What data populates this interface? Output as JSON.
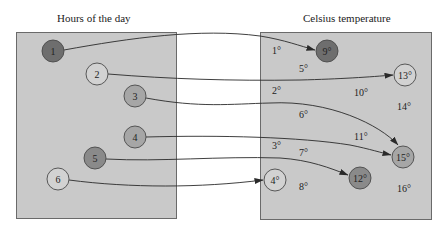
{
  "domain_sets": {
    "title": "Hours of the day",
    "items": [
      {
        "label": "1",
        "cx": 53,
        "cy": 51,
        "fill": "#6e6e6e"
      },
      {
        "label": "2",
        "cx": 97,
        "cy": 74,
        "fill": "#d2d2d2"
      },
      {
        "label": "3",
        "cx": 135,
        "cy": 96,
        "fill": "#a6a6a6"
      },
      {
        "label": "4",
        "cx": 135,
        "cy": 137,
        "fill": "#a6a6a6"
      },
      {
        "label": "5",
        "cx": 95,
        "cy": 158,
        "fill": "#8a8a8a"
      },
      {
        "label": "6",
        "cx": 58,
        "cy": 179,
        "fill": "#d2d2d2"
      }
    ]
  },
  "codomain_set": {
    "title": "Celsius temperature",
    "circled_items": [
      {
        "label": "9°",
        "cx": 327,
        "cy": 51,
        "fill": "#6e6e6e"
      },
      {
        "label": "13°",
        "cx": 405,
        "cy": 75,
        "fill": "#d2d2d2"
      },
      {
        "label": "15°",
        "cx": 403,
        "cy": 157,
        "fill": "#a6a6a6"
      },
      {
        "label": "12°",
        "cx": 360,
        "cy": 178,
        "fill": "#8a8a8a"
      },
      {
        "label": "4°",
        "cx": 275,
        "cy": 180,
        "fill": "#d2d2d2"
      }
    ],
    "free_items": [
      {
        "label": "1°",
        "x": 272,
        "y": 54
      },
      {
        "label": "5°",
        "x": 299,
        "y": 72
      },
      {
        "label": "2°",
        "x": 272,
        "y": 94
      },
      {
        "label": "10°",
        "x": 354,
        "y": 96
      },
      {
        "label": "14°",
        "x": 397,
        "y": 110
      },
      {
        "label": "6°",
        "x": 299,
        "y": 118
      },
      {
        "label": "11°",
        "x": 354,
        "y": 140
      },
      {
        "label": "3°",
        "x": 272,
        "y": 149
      },
      {
        "label": "7°",
        "x": 299,
        "y": 156
      },
      {
        "label": "8°",
        "x": 299,
        "y": 190
      },
      {
        "label": "16°",
        "x": 397,
        "y": 192
      }
    ]
  },
  "mappings": [
    {
      "from": "1",
      "to": "9°"
    },
    {
      "from": "2",
      "to": "13°"
    },
    {
      "from": "3",
      "to": "15°"
    },
    {
      "from": "4",
      "to": "15°"
    },
    {
      "from": "5",
      "to": "12°"
    },
    {
      "from": "6",
      "to": "4°"
    }
  ],
  "colors": {
    "box_fill": "#c9c9c9",
    "box_border": "#6a6a6a",
    "arrow": "#2a2a2a"
  }
}
